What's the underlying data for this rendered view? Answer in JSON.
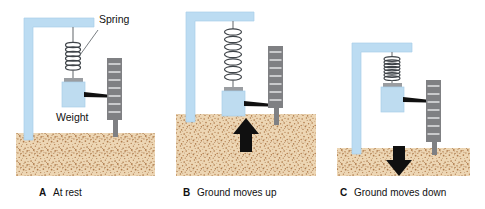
{
  "figure": {
    "panels": [
      {
        "letter": "A",
        "caption": "At rest",
        "state": "at-rest",
        "spring_state": "neutral",
        "ground_level": "normal",
        "arrow": "none",
        "annotations": [
          {
            "label": "Spring",
            "target": "spring-coil"
          },
          {
            "label": "Weight",
            "target": "weight-block"
          }
        ]
      },
      {
        "letter": "B",
        "caption": "Ground moves up",
        "state": "ground-up",
        "spring_state": "stretched",
        "ground_level": "raised",
        "arrow": "up",
        "annotations": []
      },
      {
        "letter": "C",
        "caption": "Ground moves down",
        "state": "ground-down",
        "spring_state": "compressed",
        "ground_level": "lowered",
        "arrow": "down",
        "annotations": []
      }
    ]
  },
  "labels": {
    "spring": "Spring",
    "weight": "Weight"
  },
  "colors": {
    "frame_blue": "#bcdcf2",
    "frame_blue_edge": "#a8cde8",
    "weight_blue": "#bedcf0",
    "drum_gray": "#7f8083",
    "drum_mark": "#c9cacc",
    "ground_tan": "#edd6b4",
    "ground_speck": "#b9895a",
    "arrow_black": "#101010",
    "text_black": "#111111",
    "background": "#ffffff"
  }
}
